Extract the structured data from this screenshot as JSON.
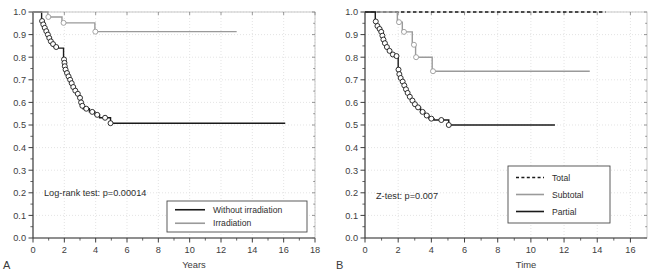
{
  "figure": {
    "name": "kaplan-meier-survival-curves",
    "panels": [
      "A",
      "B"
    ],
    "background": "#ffffff"
  },
  "colors": {
    "black": "#1a1a1a",
    "gray": "#9a9a9a",
    "axis": "#3d3d3d",
    "grid": "#d8d8d8",
    "marker_fill": "#ffffff",
    "text": "#2e2e2e"
  },
  "panel_a": {
    "letter": "A",
    "annotation": "Log-rank test: p=0.00014",
    "legend": {
      "items": [
        {
          "label": "Without irradiation",
          "color": "#1a1a1a",
          "style": "solid"
        },
        {
          "label": "Irradiation",
          "color": "#9a9a9a",
          "style": "solid"
        }
      ]
    },
    "chart_data": {
      "type": "line",
      "title": "",
      "xlabel": "Years",
      "ylabel": "",
      "xlim": [
        0,
        18
      ],
      "ylim": [
        0,
        1.0
      ],
      "xticks": [
        0,
        2,
        4,
        6,
        8,
        10,
        12,
        14,
        16,
        18
      ],
      "xticklabels": [
        "0",
        "2",
        "4",
        "6",
        "8",
        "10",
        "12",
        "14",
        "16",
        "18"
      ],
      "yticks": [
        0.0,
        0.1,
        0.2,
        0.3,
        0.4,
        0.5,
        0.6,
        0.7,
        0.8,
        0.9,
        1.0
      ],
      "yticklabels": [
        "0.0",
        "0.1",
        "0.2",
        "0.3",
        "0.4",
        "0.5",
        "0.6",
        "0.7",
        "0.8",
        "0.9",
        "1.0"
      ],
      "grid": true,
      "legend_position": "lower right",
      "series": [
        {
          "name": "Without irradiation",
          "color": "#1a1a1a",
          "style": "solid",
          "steps": [
            [
              0.0,
              1.0
            ],
            [
              0.55,
              1.0
            ],
            [
              0.55,
              0.96
            ],
            [
              0.62,
              0.96
            ],
            [
              0.62,
              0.945
            ],
            [
              0.7,
              0.945
            ],
            [
              0.7,
              0.93
            ],
            [
              0.8,
              0.93
            ],
            [
              0.8,
              0.915
            ],
            [
              0.9,
              0.915
            ],
            [
              0.9,
              0.9
            ],
            [
              1.0,
              0.9
            ],
            [
              1.0,
              0.885
            ],
            [
              1.08,
              0.885
            ],
            [
              1.08,
              0.87
            ],
            [
              1.2,
              0.87
            ],
            [
              1.2,
              0.858
            ],
            [
              1.35,
              0.858
            ],
            [
              1.35,
              0.845
            ],
            [
              1.6,
              0.845
            ],
            [
              1.6,
              0.84
            ],
            [
              1.95,
              0.84
            ],
            [
              1.95,
              0.79
            ],
            [
              2.0,
              0.79
            ],
            [
              2.0,
              0.775
            ],
            [
              2.02,
              0.775
            ],
            [
              2.02,
              0.76
            ],
            [
              2.05,
              0.76
            ],
            [
              2.05,
              0.745
            ],
            [
              2.12,
              0.745
            ],
            [
              2.12,
              0.73
            ],
            [
              2.22,
              0.73
            ],
            [
              2.22,
              0.715
            ],
            [
              2.32,
              0.715
            ],
            [
              2.32,
              0.7
            ],
            [
              2.42,
              0.7
            ],
            [
              2.42,
              0.685
            ],
            [
              2.52,
              0.685
            ],
            [
              2.52,
              0.668
            ],
            [
              2.62,
              0.668
            ],
            [
              2.62,
              0.652
            ],
            [
              2.78,
              0.652
            ],
            [
              2.78,
              0.638
            ],
            [
              2.95,
              0.638
            ],
            [
              2.95,
              0.62
            ],
            [
              3.05,
              0.62
            ],
            [
              3.05,
              0.6
            ],
            [
              3.1,
              0.6
            ],
            [
              3.1,
              0.585
            ],
            [
              3.2,
              0.585
            ],
            [
              3.2,
              0.572
            ],
            [
              3.6,
              0.572
            ],
            [
              3.6,
              0.558
            ],
            [
              3.95,
              0.558
            ],
            [
              3.95,
              0.545
            ],
            [
              4.25,
              0.545
            ],
            [
              4.25,
              0.532
            ],
            [
              4.95,
              0.532
            ],
            [
              4.95,
              0.508
            ],
            [
              16.1,
              0.508
            ]
          ],
          "censor_points": [
            [
              0.58,
              0.96
            ],
            [
              0.66,
              0.945
            ],
            [
              0.75,
              0.93
            ],
            [
              0.85,
              0.915
            ],
            [
              0.95,
              0.9
            ],
            [
              1.04,
              0.885
            ],
            [
              1.14,
              0.87
            ],
            [
              1.28,
              0.858
            ],
            [
              1.48,
              0.845
            ],
            [
              1.98,
              0.79
            ],
            [
              2.01,
              0.775
            ],
            [
              2.03,
              0.76
            ],
            [
              2.08,
              0.745
            ],
            [
              2.17,
              0.73
            ],
            [
              2.27,
              0.715
            ],
            [
              2.37,
              0.7
            ],
            [
              2.47,
              0.685
            ],
            [
              2.57,
              0.668
            ],
            [
              2.7,
              0.652
            ],
            [
              2.86,
              0.638
            ],
            [
              3.0,
              0.62
            ],
            [
              3.07,
              0.6
            ],
            [
              3.15,
              0.585
            ],
            [
              3.4,
              0.572
            ],
            [
              3.78,
              0.558
            ],
            [
              4.1,
              0.545
            ],
            [
              4.6,
              0.532
            ],
            [
              4.95,
              0.508
            ]
          ]
        },
        {
          "name": "Irradiation",
          "color": "#9a9a9a",
          "style": "solid",
          "steps": [
            [
              0.0,
              1.0
            ],
            [
              0.95,
              1.0
            ],
            [
              0.95,
              0.978
            ],
            [
              1.85,
              0.978
            ],
            [
              1.85,
              0.952
            ],
            [
              3.95,
              0.952
            ],
            [
              3.95,
              0.913
            ],
            [
              13.0,
              0.913
            ]
          ],
          "censor_points": [
            [
              0.98,
              0.978
            ],
            [
              1.95,
              0.952
            ],
            [
              3.98,
              0.913
            ]
          ]
        }
      ]
    }
  },
  "panel_b": {
    "letter": "B",
    "annotation": "Z-test: p=0.007",
    "legend": {
      "items": [
        {
          "label": "Total",
          "color": "#1a1a1a",
          "style": "dashed"
        },
        {
          "label": "Subtotal",
          "color": "#9a9a9a",
          "style": "solid"
        },
        {
          "label": "Partial",
          "color": "#1a1a1a",
          "style": "solid"
        }
      ]
    },
    "chart_data": {
      "type": "line",
      "title": "",
      "xlabel": "Time",
      "ylabel": "",
      "xlim": [
        0,
        17
      ],
      "ylim": [
        0,
        1.0
      ],
      "xticks": [
        0,
        2,
        4,
        6,
        8,
        10,
        12,
        14,
        16
      ],
      "xticklabels": [
        "0",
        "2",
        "4",
        "6",
        "8",
        "10",
        "12",
        "14",
        "16"
      ],
      "yticks": [
        0.0,
        0.1,
        0.2,
        0.3,
        0.4,
        0.5,
        0.6,
        0.7,
        0.8,
        0.9,
        1.0
      ],
      "yticklabels": [
        "0.0",
        "0.1",
        "0.2",
        "0.3",
        "0.4",
        "0.5",
        "0.6",
        "0.7",
        "0.8",
        "0.9",
        "1.0"
      ],
      "grid": true,
      "legend_position": "lower right",
      "series": [
        {
          "name": "Total",
          "color": "#1a1a1a",
          "style": "dashed",
          "steps": [
            [
              0.0,
              1.0
            ],
            [
              14.5,
              1.0
            ]
          ],
          "censor_points": []
        },
        {
          "name": "Subtotal",
          "color": "#9a9a9a",
          "style": "solid",
          "steps": [
            [
              0.0,
              1.0
            ],
            [
              1.95,
              1.0
            ],
            [
              1.95,
              0.955
            ],
            [
              2.25,
              0.955
            ],
            [
              2.25,
              0.912
            ],
            [
              2.85,
              0.912
            ],
            [
              2.85,
              0.855
            ],
            [
              3.05,
              0.855
            ],
            [
              3.05,
              0.8
            ],
            [
              4.05,
              0.8
            ],
            [
              4.05,
              0.738
            ],
            [
              13.55,
              0.738
            ]
          ],
          "censor_points": [
            [
              2.05,
              0.955
            ],
            [
              2.35,
              0.912
            ],
            [
              2.95,
              0.855
            ],
            [
              3.08,
              0.8
            ],
            [
              4.1,
              0.738
            ]
          ]
        },
        {
          "name": "Partial",
          "color": "#1a1a1a",
          "style": "solid",
          "steps": [
            [
              0.0,
              1.0
            ],
            [
              0.62,
              1.0
            ],
            [
              0.62,
              0.958
            ],
            [
              0.7,
              0.958
            ],
            [
              0.7,
              0.938
            ],
            [
              0.8,
              0.938
            ],
            [
              0.8,
              0.925
            ],
            [
              0.95,
              0.925
            ],
            [
              0.95,
              0.912
            ],
            [
              1.02,
              0.912
            ],
            [
              1.02,
              0.895
            ],
            [
              1.08,
              0.895
            ],
            [
              1.08,
              0.878
            ],
            [
              1.15,
              0.878
            ],
            [
              1.15,
              0.862
            ],
            [
              1.25,
              0.862
            ],
            [
              1.25,
              0.845
            ],
            [
              1.4,
              0.845
            ],
            [
              1.4,
              0.828
            ],
            [
              1.58,
              0.828
            ],
            [
              1.58,
              0.812
            ],
            [
              1.8,
              0.812
            ],
            [
              1.8,
              0.805
            ],
            [
              2.0,
              0.805
            ],
            [
              2.0,
              0.745
            ],
            [
              2.05,
              0.745
            ],
            [
              2.05,
              0.725
            ],
            [
              2.1,
              0.725
            ],
            [
              2.1,
              0.708
            ],
            [
              2.22,
              0.708
            ],
            [
              2.22,
              0.692
            ],
            [
              2.32,
              0.692
            ],
            [
              2.32,
              0.675
            ],
            [
              2.42,
              0.675
            ],
            [
              2.42,
              0.658
            ],
            [
              2.52,
              0.658
            ],
            [
              2.52,
              0.642
            ],
            [
              2.62,
              0.642
            ],
            [
              2.62,
              0.625
            ],
            [
              2.78,
              0.625
            ],
            [
              2.78,
              0.608
            ],
            [
              2.95,
              0.608
            ],
            [
              2.95,
              0.592
            ],
            [
              3.08,
              0.592
            ],
            [
              3.08,
              0.578
            ],
            [
              3.35,
              0.578
            ],
            [
              3.35,
              0.558
            ],
            [
              3.6,
              0.558
            ],
            [
              3.6,
              0.542
            ],
            [
              3.85,
              0.542
            ],
            [
              3.85,
              0.528
            ],
            [
              4.15,
              0.528
            ],
            [
              4.15,
              0.522
            ],
            [
              5.05,
              0.522
            ],
            [
              5.05,
              0.5
            ],
            [
              11.45,
              0.5
            ]
          ],
          "censor_points": [
            [
              0.65,
              0.958
            ],
            [
              0.75,
              0.938
            ],
            [
              0.88,
              0.925
            ],
            [
              0.98,
              0.912
            ],
            [
              1.05,
              0.895
            ],
            [
              1.11,
              0.878
            ],
            [
              1.2,
              0.862
            ],
            [
              1.32,
              0.845
            ],
            [
              1.48,
              0.828
            ],
            [
              1.68,
              0.812
            ],
            [
              1.9,
              0.805
            ],
            [
              2.02,
              0.745
            ],
            [
              2.07,
              0.725
            ],
            [
              2.15,
              0.708
            ],
            [
              2.27,
              0.692
            ],
            [
              2.37,
              0.675
            ],
            [
              2.47,
              0.658
            ],
            [
              2.57,
              0.642
            ],
            [
              2.7,
              0.625
            ],
            [
              2.86,
              0.608
            ],
            [
              3.01,
              0.592
            ],
            [
              3.2,
              0.578
            ],
            [
              3.47,
              0.558
            ],
            [
              3.72,
              0.542
            ],
            [
              4.0,
              0.528
            ],
            [
              4.6,
              0.522
            ],
            [
              5.05,
              0.5
            ]
          ]
        }
      ]
    }
  }
}
